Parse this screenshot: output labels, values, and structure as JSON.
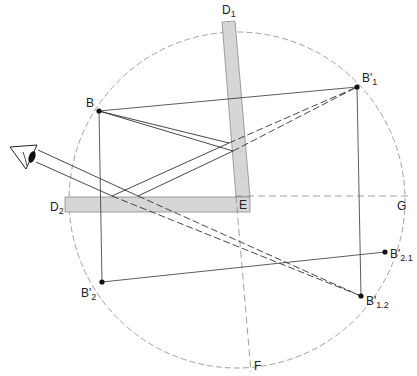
{
  "diagram": {
    "type": "optics-two-mirror-reflection",
    "circle": {
      "cx": 237,
      "cy": 200,
      "r": 168
    },
    "mirrors": [
      {
        "id": "D1",
        "label": "D",
        "sub": "1"
      },
      {
        "id": "D2",
        "label": "D",
        "sub": "2"
      }
    ],
    "points": [
      {
        "id": "B",
        "label": "B",
        "sub": ""
      },
      {
        "id": "B1",
        "label": "B'",
        "sub": "1"
      },
      {
        "id": "B2",
        "label": "B'",
        "sub": "2"
      },
      {
        "id": "B21",
        "label": "B'",
        "sub": "2.1"
      },
      {
        "id": "B12",
        "label": "B'",
        "sub": "1.2"
      },
      {
        "id": "E",
        "label": "E",
        "sub": ""
      },
      {
        "id": "F",
        "label": "F",
        "sub": ""
      },
      {
        "id": "G",
        "label": "G",
        "sub": ""
      }
    ],
    "observer": "eye-icon",
    "colors": {
      "line": "#333333",
      "mirror_fill": "#d4d4d4",
      "mirror_stroke": "#888888",
      "construction": "#888888"
    }
  }
}
